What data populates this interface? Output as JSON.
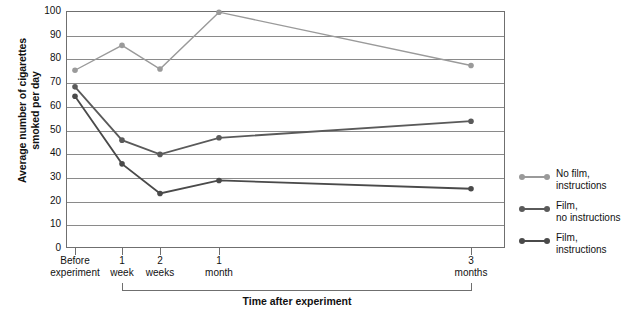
{
  "chart_data": {
    "type": "line",
    "title": "",
    "xlabel": "Time after experiment",
    "ylabel": "Average number of cigarettes smoked per day",
    "categories": [
      "Before experiment",
      "1 week",
      "2 weeks",
      "1 month",
      "3 months"
    ],
    "category_lines": [
      [
        "Before",
        "experiment"
      ],
      [
        "1",
        "week"
      ],
      [
        "2",
        "weeks"
      ],
      [
        "1",
        "month"
      ],
      [
        "3",
        "months"
      ]
    ],
    "ylim": [
      0,
      100
    ],
    "yticks": [
      100,
      90,
      80,
      70,
      60,
      50,
      40,
      30,
      20,
      10,
      0
    ],
    "grid": true,
    "legend_position": "right",
    "series": [
      {
        "name": "No film, instructions",
        "name_lines": [
          "No film,",
          "instructions"
        ],
        "color": "#9a9a9a",
        "values": [
          75,
          85.5,
          75.5,
          99.5,
          77
        ]
      },
      {
        "name": "Film, no instructions",
        "name_lines": [
          "Film,",
          "no instructions"
        ],
        "color": "#5a5a5a",
        "values": [
          68,
          45.5,
          39.5,
          46.5,
          53.5
        ]
      },
      {
        "name": "Film, instructions",
        "name_lines": [
          "Film,",
          "instructions"
        ],
        "color": "#4a4a4a",
        "values": [
          64,
          35.5,
          23,
          28.5,
          25
        ]
      }
    ]
  },
  "axis": {
    "y_title": "Average number of cigarettes smoked per day",
    "x_title": "Time after experiment"
  }
}
